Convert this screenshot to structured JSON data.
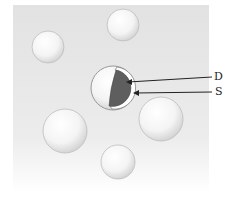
{
  "figure": {
    "background_color": "#e6e6e6",
    "spheres": [
      {
        "id": "top-center",
        "cx": 123,
        "cy": 25,
        "r": 16
      },
      {
        "id": "top-left",
        "cx": 48,
        "cy": 47,
        "r": 16
      },
      {
        "id": "right",
        "cx": 161,
        "cy": 119,
        "r": 22
      },
      {
        "id": "left",
        "cx": 65,
        "cy": 131,
        "r": 22
      },
      {
        "id": "bottom",
        "cx": 118,
        "cy": 162,
        "r": 17
      }
    ],
    "central_sphere": {
      "cx": 111,
      "cy": 88,
      "r": 22,
      "core_color": "#5e5e5e"
    },
    "labels": {
      "d": "D",
      "s": "S"
    }
  }
}
